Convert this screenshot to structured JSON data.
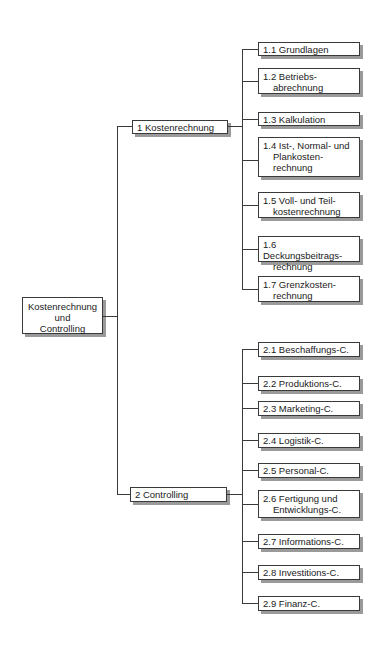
{
  "root": {
    "lines": [
      "Kostenrechnung",
      "und",
      "Controlling"
    ]
  },
  "branches": [
    {
      "label": "1 Kostenrechnung",
      "children": [
        {
          "line1": "1.1 Grundlagen",
          "line2": "",
          "line3": ""
        },
        {
          "line1": "1.2 Betriebs-",
          "line2": "abrechnung",
          "line3": ""
        },
        {
          "line1": "1.3 Kalkulation",
          "line2": "",
          "line3": ""
        },
        {
          "line1": "1.4 Ist-, Normal- und",
          "line2": "Plankosten-",
          "line3": "rechnung"
        },
        {
          "line1": "1.5 Voll- und Teil-",
          "line2": "kostenrechnung",
          "line3": ""
        },
        {
          "line1": "1.6 Deckungsbeitrags-",
          "line2": "rechnung",
          "line3": ""
        },
        {
          "line1": "1.7 Grenzkosten-",
          "line2": "rechnung",
          "line3": ""
        }
      ]
    },
    {
      "label": "2 Controlling",
      "children": [
        {
          "line1": "2.1 Beschaffungs-C.",
          "line2": "",
          "line3": ""
        },
        {
          "line1": "2.2 Produktions-C.",
          "line2": "",
          "line3": ""
        },
        {
          "line1": "2.3 Marketing-C.",
          "line2": "",
          "line3": ""
        },
        {
          "line1": "2.4 Logistik-C.",
          "line2": "",
          "line3": ""
        },
        {
          "line1": "2.5 Personal-C.",
          "line2": "",
          "line3": ""
        },
        {
          "line1": "2.6 Fertigung und",
          "line2": "Entwicklungs-C.",
          "line3": ""
        },
        {
          "line1": "2.7 Informations-C.",
          "line2": "",
          "line3": ""
        },
        {
          "line1": "2.8 Investitions-C.",
          "line2": "",
          "line3": ""
        },
        {
          "line1": "2.9 Finanz-C.",
          "line2": "",
          "line3": ""
        }
      ]
    }
  ],
  "colors": {
    "line": "#3a3a3a",
    "box_fill": "#ffffff",
    "shadow": "#9a9a9a"
  }
}
